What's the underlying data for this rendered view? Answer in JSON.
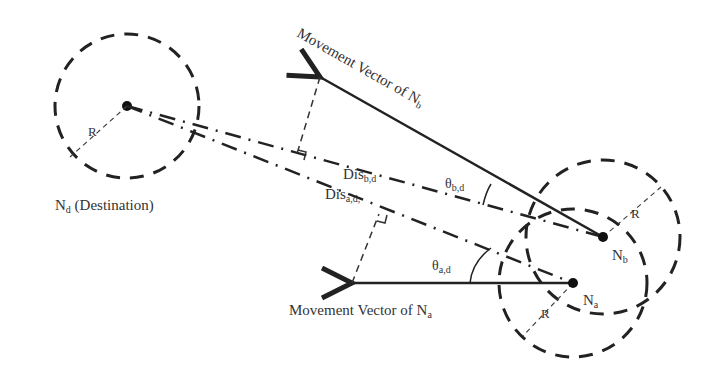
{
  "diagram": {
    "nodes": {
      "destination": {
        "label": "N",
        "sub": "d",
        "suffix": " (Destination)",
        "radius_label": "R"
      },
      "a": {
        "label": "N",
        "sub": "a",
        "radius_label": "R"
      },
      "b": {
        "label": "N",
        "sub": "b",
        "radius_label": "R"
      }
    },
    "vectors": {
      "a": {
        "label": "Movement Vector of N",
        "sub": "a"
      },
      "b": {
        "label": "Movement Vector of N",
        "sub": "b"
      }
    },
    "distances": {
      "a": {
        "label": "Dis",
        "sub": "a,d,"
      },
      "b": {
        "label": "Dis",
        "sub": "b,d"
      }
    },
    "angles": {
      "a": {
        "label": "θ",
        "sub": "a,d"
      },
      "b": {
        "label": "θ",
        "sub": "b,d"
      }
    },
    "colors": {
      "line": "#222222",
      "text": "#333333",
      "background": "#ffffff"
    }
  }
}
